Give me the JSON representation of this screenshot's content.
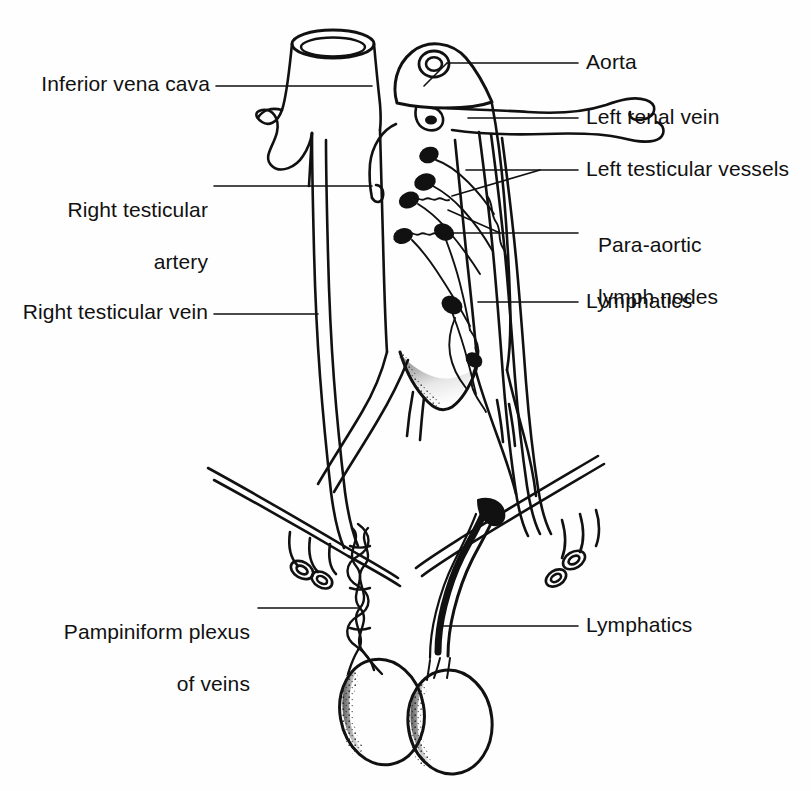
{
  "figure": {
    "type": "anatomical line diagram",
    "background_color": "#fefefe",
    "ink_color": "#111111"
  },
  "labels": {
    "inferior_vena_cava": "Inferior vena cava",
    "right_testicular_artery_l1": "Right testicular",
    "right_testicular_artery_l2": "artery",
    "right_testicular_vein": "Right testicular vein",
    "pampiniform_plexus_l1": "Pampiniform plexus",
    "pampiniform_plexus_l2": "of veins",
    "aorta": "Aorta",
    "left_renal_vein": "Left renal vein",
    "left_testicular_vessels": "Left testicular vessels",
    "para_aortic_l1": "Para-aortic",
    "para_aortic_l2": "lymph nodes",
    "lymphatics_upper": "Lymphatics",
    "lymphatics_lower": "Lymphatics"
  },
  "structures": [
    "inferior vena cava",
    "abdominal aorta",
    "left renal vein",
    "right renal vein",
    "left testicular vessels",
    "right testicular artery",
    "right testicular vein",
    "para-aortic lymph nodes",
    "lymphatics",
    "common iliac vessels",
    "inguinal ligament",
    "pampiniform plexus of veins",
    "testis"
  ]
}
